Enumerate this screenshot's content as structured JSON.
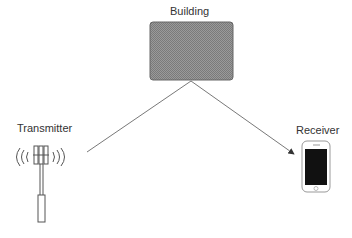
{
  "diagram": {
    "building": {
      "label": "Building",
      "fill": "#8a8a8a",
      "stroke": "#666666"
    },
    "transmitter": {
      "label": "Transmitter"
    },
    "receiver": {
      "label": "Receiver"
    },
    "paths": [
      {
        "from": "transmitter",
        "to": "building"
      },
      {
        "from": "building",
        "to": "receiver",
        "arrow": true
      }
    ]
  }
}
